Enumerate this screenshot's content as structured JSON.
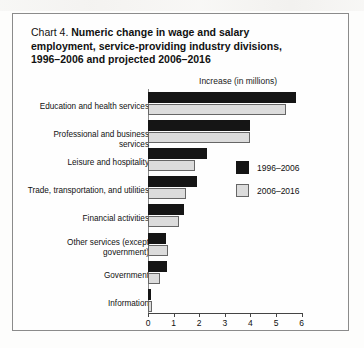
{
  "chart_data": {
    "type": "bar",
    "orientation": "horizontal",
    "number_label": "Chart 4.",
    "title": "Numeric change in wage and salary employment, service-providing industry divisions, 1996–2006 and projected 2006–2016",
    "title_lines": [
      "Numeric change in wage and salary",
      "employment, service-providing industry divisions,",
      "1996–2006 and projected 2006–2016"
    ],
    "axis_title": "Increase (in millions)",
    "xlabel": "Increase (in millions)",
    "ylabel": "",
    "xlim": [
      0,
      6
    ],
    "xticks": [
      0,
      1,
      2,
      3,
      4,
      5,
      6
    ],
    "xticklabels": [
      "0",
      "1",
      "2",
      "3",
      "4",
      "5",
      "6"
    ],
    "grid": false,
    "legend_position": "center-right",
    "categories": [
      "Education and health services",
      "Professional and business services",
      "Leisure and hospitality",
      "Trade, transportation, and utilities",
      "Financial activities",
      "Other services (except government)",
      "Government",
      "Information"
    ],
    "category_label_lines": [
      [
        "Education and health services"
      ],
      [
        "Professional and business services"
      ],
      [
        "Leisure and hospitality"
      ],
      [
        "Trade, transportation, and utilities"
      ],
      [
        "Financial activities"
      ],
      [
        "Other services (except",
        "government)"
      ],
      [
        "Government"
      ],
      [
        "Information"
      ]
    ],
    "series": [
      {
        "name": "1996–2006",
        "color": "#151515",
        "values": [
          5.8,
          4.0,
          2.3,
          1.9,
          1.4,
          0.72,
          0.73,
          0.1
        ]
      },
      {
        "name": "2006–2016",
        "color": "#dcdcdc",
        "values": [
          5.4,
          4.0,
          1.85,
          1.5,
          1.2,
          0.78,
          0.45,
          0.17
        ]
      }
    ]
  }
}
